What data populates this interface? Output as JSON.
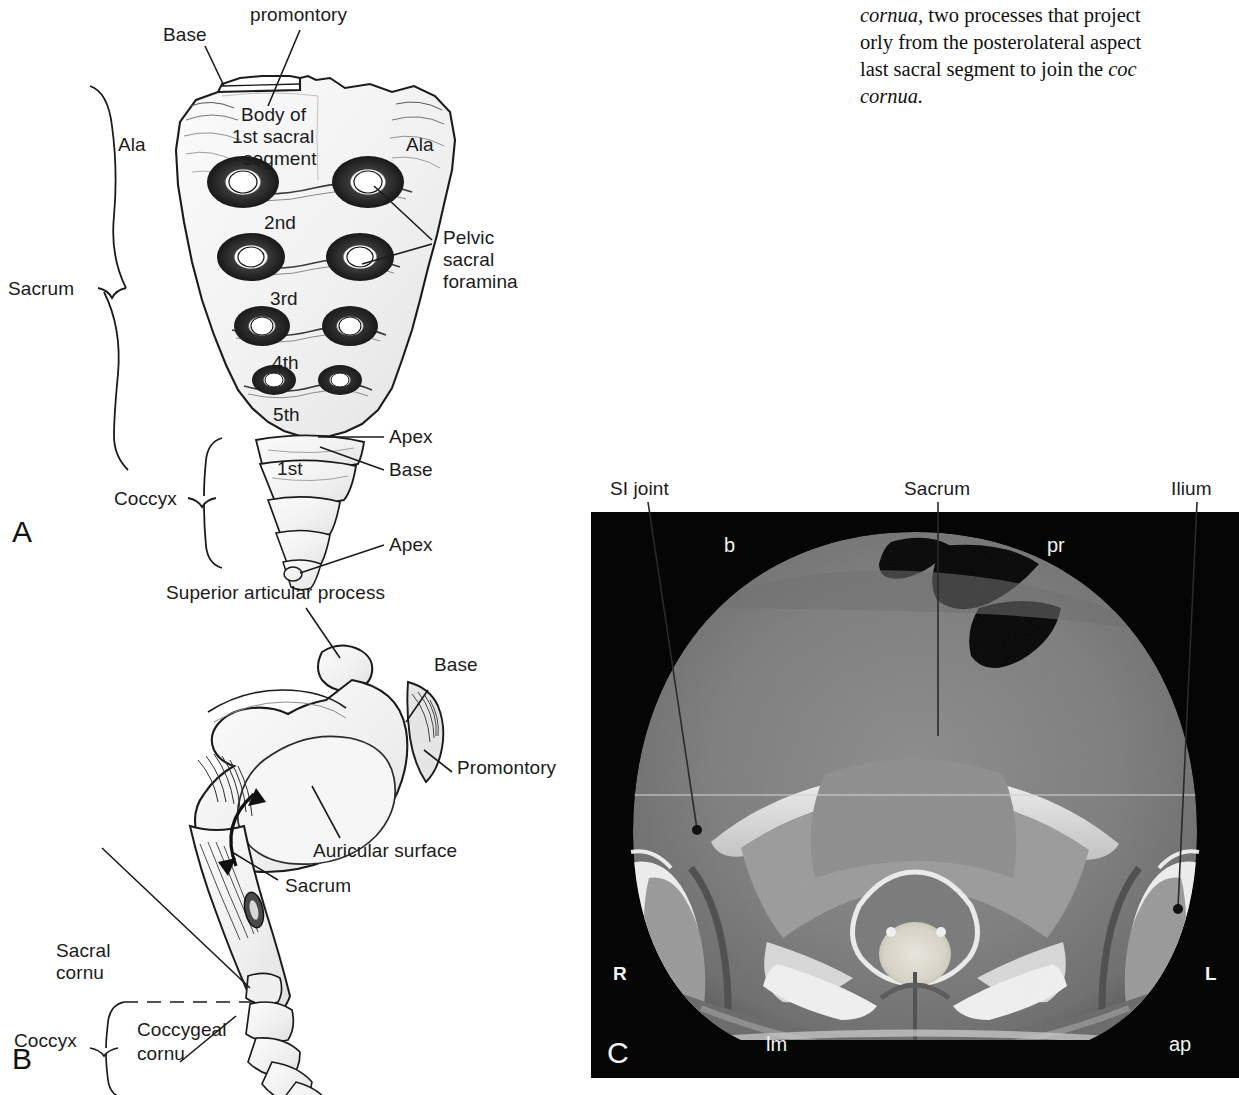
{
  "document": {
    "type": "anatomy-textbook-figure-page",
    "background_color": "#ffffff"
  },
  "body_text": {
    "lines": [
      "cornua, two processes that project",
      "orly from the posterolateral aspect",
      "last sacral segment to join the coc",
      "cornua."
    ],
    "note": "column text clipped at right page edge"
  },
  "panel_a": {
    "letter": "A",
    "caption_view": "anterior view of sacrum and coccyx",
    "labels": {
      "promontory": "promontory",
      "base": "Base",
      "ala_left": "Ala",
      "ala_right": "Ala",
      "body_line1": "Body of",
      "body_line2": "1st sacral",
      "body_line3": "segment",
      "segment_2": "2nd",
      "segment_3": "3rd",
      "segment_4": "4th",
      "segment_5": "5th",
      "foramina_line1": "Pelvic",
      "foramina_line2": "sacral",
      "foramina_line3": "foramina",
      "sacrum": "Sacrum",
      "coccyx": "Coccyx",
      "coccyx_1st": "1st",
      "apex_sacrum": "Apex",
      "base_coccyx": "Base",
      "apex_coccyx": "Apex"
    }
  },
  "panel_b": {
    "letter": "B",
    "caption_view": "lateral view of sacrum and coccyx",
    "labels": {
      "superior_articular_process": "Superior articular process",
      "base": "Base",
      "promontory": "Promontory",
      "auricular_surface": "Auricular surface",
      "sacrum": "Sacrum",
      "sacral_cornu_line1": "Sacral",
      "sacral_cornu_line2": "cornu",
      "coccyx": "Coccyx",
      "coccygeal_cornu_line1": "Coccygeal",
      "coccygeal_cornu_line2": "cornu"
    }
  },
  "panel_c": {
    "letter": "C",
    "caption_view": "axial CT of sacrum and sacroiliac joints",
    "external_labels": [
      {
        "name": "si-joint",
        "text": "SI joint"
      },
      {
        "name": "sacrum",
        "text": "Sacrum"
      },
      {
        "name": "ilium",
        "text": "Ilium"
      }
    ],
    "image_markers": [
      {
        "name": "marker-b",
        "text": "b"
      },
      {
        "name": "marker-pr",
        "text": "pr"
      },
      {
        "name": "marker-right",
        "text": "R"
      },
      {
        "name": "marker-left",
        "text": "L"
      },
      {
        "name": "marker-lm",
        "text": "lm"
      },
      {
        "name": "marker-ap",
        "text": "ap"
      }
    ],
    "colors": {
      "background": "#050505",
      "soft_tissue": "#7d7d7d",
      "bone": "#dcdcdc",
      "marker_text": "#f2f2f2"
    }
  }
}
